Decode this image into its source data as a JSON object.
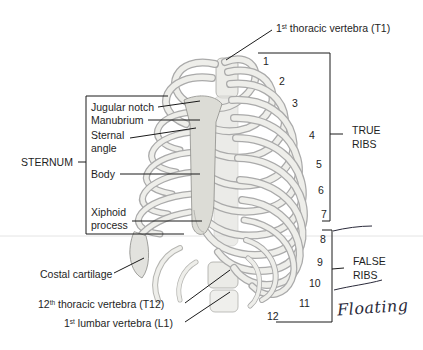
{
  "diagram": {
    "labels": {
      "t1": {
        "sup_num": "1",
        "sup": "st",
        "text": " thoracic vertebra (T1)"
      },
      "jugular_notch": "Jugular notch",
      "manubrium": "Manubrium",
      "sternal_angle_1": "Sternal",
      "sternal_angle_2": "angle",
      "body": "Body",
      "xiphoid_1": "Xiphoid",
      "xiphoid_2": "process",
      "sternum": "STERNUM",
      "costal_cartilage": "Costal cartilage",
      "t12": {
        "sup_num": "12",
        "sup": "th",
        "text": " thoracic vertebra (T12)"
      },
      "l1": {
        "sup_num": "1",
        "sup": "st",
        "text": " lumbar vertebra (L1)"
      },
      "true_ribs_1": "TRUE",
      "true_ribs_2": "RIBS",
      "false_ribs_1": "FALSE",
      "false_ribs_2": "RIBS"
    },
    "rib_numbers": [
      "1",
      "2",
      "3",
      "4",
      "5",
      "6",
      "7",
      "8",
      "9",
      "10",
      "11",
      "12"
    ],
    "handwritten_note": "Floating",
    "colors": {
      "bone": "#e6e6e2",
      "bone_shade": "#bdbdb8",
      "outline": "#6d6d6a",
      "leader": "#1a1a1a"
    }
  }
}
